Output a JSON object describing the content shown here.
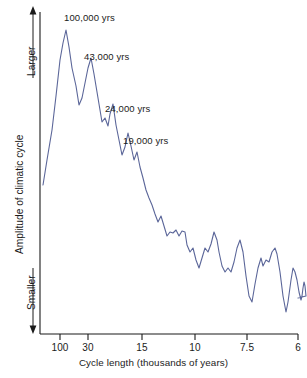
{
  "figure": {
    "background_color": "#ffffff",
    "line_color": "#5b6699",
    "axis_color": "#1b1b1b",
    "text_color": "#1b1b1b"
  },
  "axes": {
    "y_axis_label": "Amplitude of climatic cycle",
    "y_top_label": "Larger",
    "y_bottom_label": "Smaller",
    "x_axis_label": "Cycle length (thousands of years)",
    "x_tick_labels": [
      "100",
      "30",
      "15",
      "10",
      "7.5",
      "6"
    ],
    "x_tick_positions_px": [
      60,
      88,
      142,
      195,
      247,
      298
    ]
  },
  "annotations": [
    {
      "text": "100,000 yrs",
      "x_px": 64,
      "y_px": 13
    },
    {
      "text": "43,000 yrs",
      "x_px": 84,
      "y_px": 52
    },
    {
      "text": "24,000 yrs",
      "x_px": 105,
      "y_px": 104
    },
    {
      "text": "19,000 yrs",
      "x_px": 123,
      "y_px": 136
    }
  ],
  "chart_data": {
    "type": "line",
    "title": "",
    "subtitle": "",
    "xlabel": "Cycle length (thousands of years)",
    "ylabel": "Amplitude of climatic cycle",
    "xlabel_ticks": [
      "100",
      "30",
      "15",
      "10",
      "7.5",
      "6"
    ],
    "ylabel_ticks": [
      "Smaller",
      "Larger"
    ],
    "x_scale": "frequency-linear (period decreasing to the right)",
    "grid": false,
    "legend": null,
    "ylim_semantic": [
      "Smaller",
      "Larger"
    ],
    "annotated_peaks": [
      {
        "label": "100,000 yrs",
        "period_kyr": 100,
        "amplitude_rank": 1
      },
      {
        "label": "43,000 yrs",
        "period_kyr": 43,
        "amplitude_rank": 2
      },
      {
        "label": "24,000 yrs",
        "period_kyr": 24,
        "amplitude_rank": 3
      },
      {
        "label": "19,000 yrs",
        "period_kyr": 19,
        "amplitude_rank": 4
      }
    ],
    "points_px": [
      [
        43,
        185
      ],
      [
        47,
        160
      ],
      [
        52,
        130
      ],
      [
        56,
        96
      ],
      [
        60,
        60
      ],
      [
        63,
        43
      ],
      [
        66,
        30
      ],
      [
        69,
        47
      ],
      [
        72,
        68
      ],
      [
        76,
        86
      ],
      [
        79,
        105
      ],
      [
        82,
        98
      ],
      [
        85,
        83
      ],
      [
        88,
        68
      ],
      [
        91,
        58
      ],
      [
        94,
        74
      ],
      [
        97,
        92
      ],
      [
        100,
        110
      ],
      [
        102,
        122
      ],
      [
        105,
        118
      ],
      [
        108,
        126
      ],
      [
        110,
        114
      ],
      [
        113,
        104
      ],
      [
        116,
        125
      ],
      [
        119,
        140
      ],
      [
        122,
        155
      ],
      [
        125,
        147
      ],
      [
        128,
        133
      ],
      [
        131,
        146
      ],
      [
        134,
        160
      ],
      [
        137,
        152
      ],
      [
        140,
        167
      ],
      [
        143,
        178
      ],
      [
        146,
        190
      ],
      [
        149,
        198
      ],
      [
        152,
        205
      ],
      [
        155,
        214
      ],
      [
        158,
        222
      ],
      [
        161,
        216
      ],
      [
        164,
        226
      ],
      [
        167,
        236
      ],
      [
        170,
        232
      ],
      [
        173,
        233
      ],
      [
        176,
        230
      ],
      [
        179,
        236
      ],
      [
        182,
        231
      ],
      [
        185,
        232
      ],
      [
        187,
        245
      ],
      [
        190,
        252
      ],
      [
        193,
        248
      ],
      [
        196,
        260
      ],
      [
        199,
        268
      ],
      [
        202,
        258
      ],
      [
        205,
        248
      ],
      [
        208,
        252
      ],
      [
        211,
        244
      ],
      [
        214,
        232
      ],
      [
        217,
        240
      ],
      [
        219,
        252
      ],
      [
        222,
        266
      ],
      [
        225,
        272
      ],
      [
        228,
        268
      ],
      [
        231,
        272
      ],
      [
        234,
        262
      ],
      [
        237,
        248
      ],
      [
        240,
        240
      ],
      [
        243,
        252
      ],
      [
        246,
        276
      ],
      [
        249,
        296
      ],
      [
        252,
        302
      ],
      [
        255,
        284
      ],
      [
        258,
        268
      ],
      [
        261,
        258
      ],
      [
        263,
        266
      ],
      [
        266,
        260
      ],
      [
        269,
        262
      ],
      [
        272,
        252
      ],
      [
        275,
        248
      ],
      [
        277,
        254
      ],
      [
        280,
        272
      ],
      [
        283,
        296
      ],
      [
        286,
        312
      ],
      [
        288,
        302
      ],
      [
        291,
        280
      ],
      [
        293,
        268
      ],
      [
        295,
        272
      ],
      [
        297,
        280
      ],
      [
        299,
        292
      ],
      [
        301,
        300
      ],
      [
        302,
        296
      ],
      [
        303,
        288
      ],
      [
        304,
        282
      ],
      [
        305,
        286
      ],
      [
        306,
        296
      ],
      [
        298,
        298
      ]
    ]
  }
}
